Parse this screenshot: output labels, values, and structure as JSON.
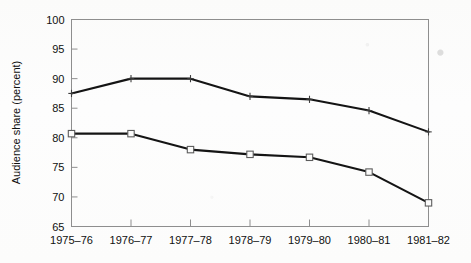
{
  "chart_data": {
    "type": "line",
    "title": "",
    "subtitle": "",
    "xlabel": "",
    "ylabel": "Audience share (percent)",
    "categories": [
      "1975–76",
      "1976–77",
      "1977–78",
      "1978–79",
      "1979–80",
      "1980–81",
      "1981–82"
    ],
    "ylim": [
      65,
      100
    ],
    "yticks": [
      65,
      70,
      75,
      80,
      85,
      90,
      95,
      100
    ],
    "ytick_labels": [
      "65",
      "70",
      "75",
      "80",
      "85",
      "90",
      "95",
      "100"
    ],
    "grid": false,
    "legend": "none",
    "series": [
      {
        "name": "upper-series",
        "marker": "cross",
        "color": "#141414",
        "values": [
          87.5,
          90.0,
          90.0,
          87.0,
          86.5,
          84.6,
          81.0
        ]
      },
      {
        "name": "lower-series",
        "marker": "open-square",
        "color": "#141414",
        "values": [
          80.7,
          80.7,
          78.0,
          77.2,
          76.7,
          74.2,
          69.0
        ]
      }
    ]
  },
  "figure": {
    "background_color": "#fdfdfc",
    "axis_color": "#8e8e8e",
    "line_color": "#141414"
  }
}
